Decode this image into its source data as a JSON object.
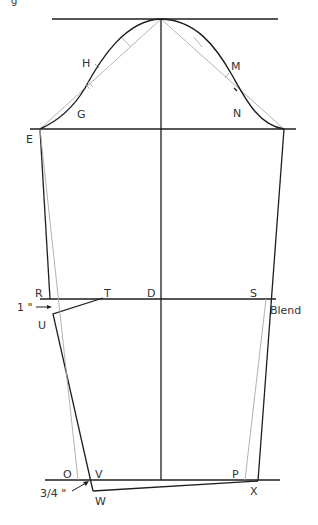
{
  "figure": {
    "caption_fragment": "g"
  },
  "labels": {
    "E": "E",
    "G": "G",
    "H": "H",
    "M": "M",
    "N": "N",
    "R": "R",
    "T": "T",
    "D": "D",
    "S": "S",
    "U": "U",
    "O": "O",
    "V": "V",
    "W": "W",
    "P": "P",
    "X": "X"
  },
  "annotations": {
    "one_inch": "1 \"",
    "three_quarter_inch": "3/4 \"",
    "blend": "Blend"
  },
  "colors": {
    "line_dark": "#1e1e1e",
    "line_guide": "#aaaaaa",
    "text": "#333333",
    "background": "#ffffff"
  }
}
